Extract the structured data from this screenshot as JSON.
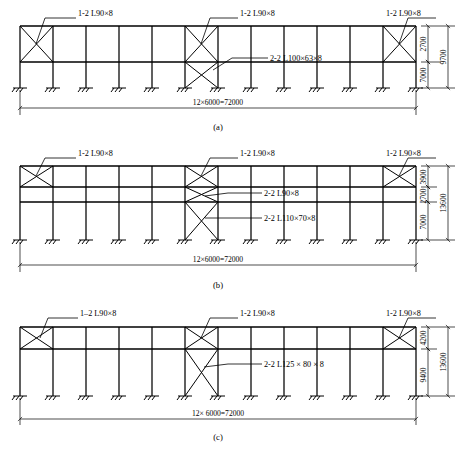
{
  "drawing": {
    "title": "Braced steel frame elevations",
    "panels": [
      {
        "id": "a",
        "caption": "(a)",
        "span_label": "12×6000=72000",
        "bays": 12,
        "labels": {
          "left_brace": "1-2 L90×8",
          "mid_brace": "1-2 L90×8",
          "right_brace": "1-2 L90×8",
          "lower_brace": "2-2 L100×63×8"
        },
        "heights": [
          "2700",
          "7000"
        ],
        "total_height": "9700"
      },
      {
        "id": "b",
        "caption": "(b)",
        "span_label": "12×6000=72000",
        "bays": 12,
        "labels": {
          "left_brace": "1-2 L90×8",
          "mid_brace": "1-2 L90×8",
          "right_brace": "1-2 L90×8",
          "mid_lower_brace": "2-2 L90×8",
          "lower_brace": "2-2 L110×70×8"
        },
        "heights": [
          "3900",
          "2700",
          "7000"
        ],
        "total_height": "13600"
      },
      {
        "id": "c",
        "caption": "(c)",
        "span_label": "12× 6000=72000",
        "bays": 12,
        "labels": {
          "left_brace": "1–2 L90×8",
          "mid_brace": "1-2 L90×8",
          "right_brace": "1-2 L90×8",
          "lower_brace": "2-2 L125 × 80 × 8"
        },
        "heights": [
          "4200",
          "9400"
        ],
        "total_height": "13600"
      }
    ],
    "colors": {
      "line": "#000000",
      "background": "#ffffff"
    }
  }
}
